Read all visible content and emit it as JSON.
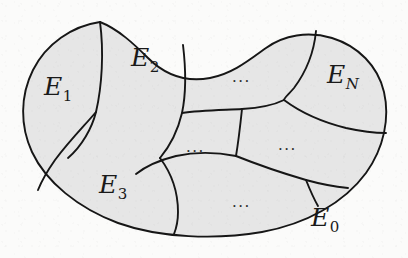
{
  "figure": {
    "kind": "venn-partition-diagram",
    "colors": {
      "background": "#fbfbfa",
      "region_fill": "#e6e6e6",
      "stroke": "#161616"
    },
    "stroke_width": 1.9,
    "regions": [
      {
        "id": "E1",
        "base": "E",
        "sub": "1",
        "sub_style": "upright",
        "x": 44,
        "y": 74,
        "name": "region-label-e1"
      },
      {
        "id": "E2",
        "base": "E",
        "sub": "2",
        "sub_style": "upright",
        "x": 131,
        "y": 45,
        "name": "region-label-e2"
      },
      {
        "id": "EN",
        "base": "E",
        "sub": "N",
        "sub_style": "italic",
        "x": 327,
        "y": 62,
        "name": "region-label-en"
      },
      {
        "id": "E3",
        "base": "E",
        "sub": "3",
        "sub_style": "upright",
        "x": 99,
        "y": 172,
        "name": "region-label-e3"
      },
      {
        "id": "E0",
        "base": "E",
        "sub": "0",
        "sub_style": "upright",
        "x": 311,
        "y": 205,
        "name": "region-label-e0"
      }
    ],
    "ellipses": [
      {
        "text": "...",
        "x": 232,
        "y": 70,
        "name": "ellipsis-top-middle"
      },
      {
        "text": "...",
        "x": 186,
        "y": 140,
        "name": "ellipsis-center-left"
      },
      {
        "text": "...",
        "x": 278,
        "y": 138,
        "name": "ellipsis-center-right"
      },
      {
        "text": "...",
        "x": 232,
        "y": 195,
        "name": "ellipsis-bottom-middle"
      }
    ]
  }
}
